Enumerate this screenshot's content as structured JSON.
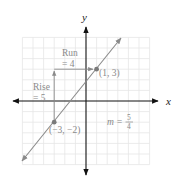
{
  "diagram": {
    "type": "coordinate-plane",
    "x_axis_label": "x",
    "y_axis_label": "y",
    "grid_range": [
      -6,
      6
    ],
    "origin_px": [
      86,
      101
    ],
    "unit_px": 10.6,
    "colors": {
      "axes": "#111111",
      "grid": "#e6e6e6",
      "line": "#8a8a8a",
      "annotation": "#8a8a8a"
    },
    "line": {
      "slope_label": "m =",
      "slope_numerator": "5",
      "slope_denominator": "4",
      "slope": 1.25
    },
    "points": [
      {
        "x": 1,
        "y": 3,
        "label": "(1, 3)"
      },
      {
        "x": -3,
        "y": -2,
        "label": "(−3, −2)"
      }
    ],
    "run": {
      "label_line1": "Run",
      "label_line2": "= 4",
      "value": 4
    },
    "rise": {
      "label_line1": "Rise",
      "label_line2": "= 5",
      "value": 5
    }
  }
}
